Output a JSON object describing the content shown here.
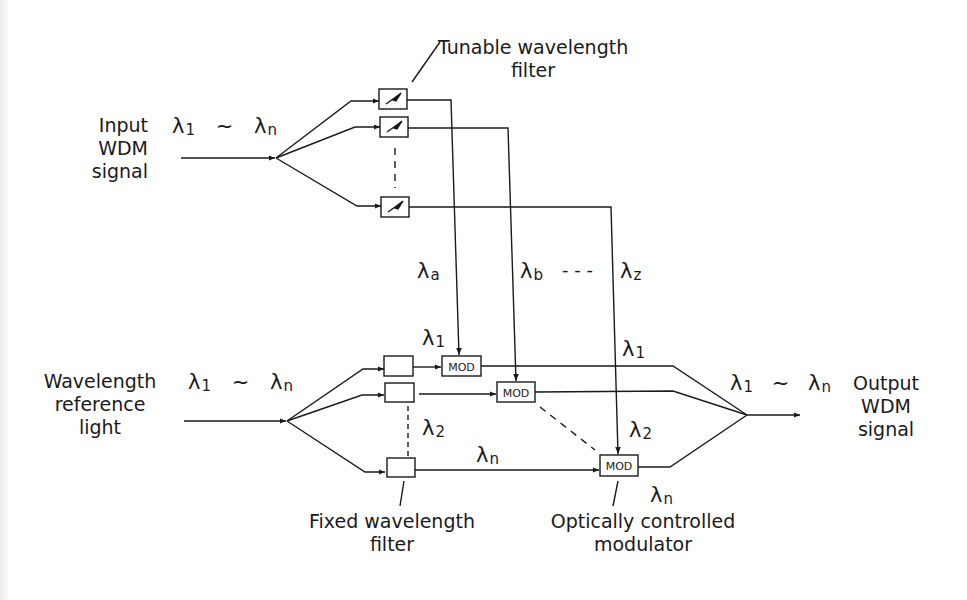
{
  "diagram": {
    "type": "optical WDM wavelength conversion block diagram",
    "colors": {
      "ink": "#1a1a1a",
      "background": "#ffffff"
    },
    "input": {
      "label_lines": [
        "Input",
        "WDM",
        "signal"
      ],
      "wavelength_range": {
        "start": "λ",
        "start_sub": "1",
        "sep": "~",
        "end": "λ",
        "end_sub": "n"
      }
    },
    "tunable_filter": {
      "label_lines": [
        "Tunable wavelength",
        "filter"
      ],
      "count_shown": 3,
      "icon": "tunable-arrow-icon"
    },
    "control_wavelengths": [
      {
        "sym": "λ",
        "sub": "a"
      },
      {
        "sym": "λ",
        "sub": "b"
      },
      {
        "sym": "λ",
        "sub": "z"
      }
    ],
    "control_ellipsis": "- - -",
    "reference": {
      "label_lines": [
        "Wavelength",
        "reference",
        "light"
      ],
      "wavelength_range": {
        "start": "λ",
        "start_sub": "1",
        "sep": "~",
        "end": "λ",
        "end_sub": "n"
      }
    },
    "fixed_filter": {
      "label_lines": [
        "Fixed wavelength",
        "filter"
      ],
      "count_shown": 3
    },
    "branch_wavelengths": {
      "first": {
        "sym": "λ",
        "sub": "1"
      },
      "second": {
        "sym": "λ",
        "sub": "2"
      },
      "last": {
        "sym": "λ",
        "sub": "n"
      }
    },
    "modulators": {
      "label": "MOD",
      "count_shown": 3,
      "caption_lines": [
        "Optically controlled",
        "modulator"
      ]
    },
    "output_wavelengths": {
      "first": {
        "sym": "λ",
        "sub": "1"
      },
      "second": {
        "sym": "λ",
        "sub": "2"
      },
      "last": {
        "sym": "λ",
        "sub": "n"
      }
    },
    "output": {
      "label_lines": [
        "Output",
        "WDM",
        "signal"
      ],
      "wavelength_range": {
        "start": "λ",
        "start_sub": "1",
        "sep": "~",
        "end": "λ",
        "end_sub": "n"
      }
    }
  }
}
